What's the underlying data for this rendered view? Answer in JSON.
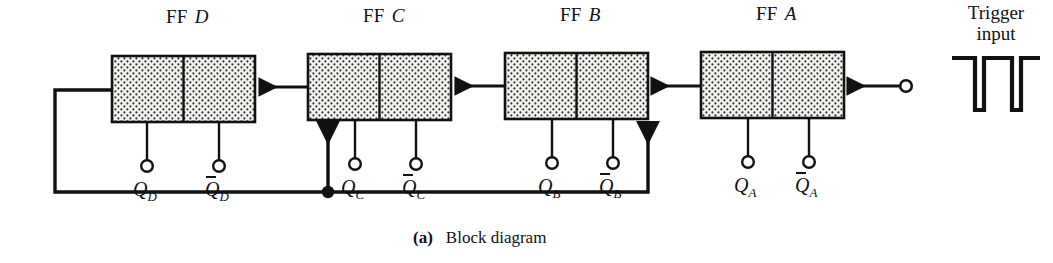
{
  "figure": {
    "caption_tag": "(a)",
    "caption_text": "Block diagram",
    "background_color": "#ffffff",
    "ink_color": "#111111"
  },
  "trigger": {
    "label_line1": "Trigger",
    "label_line2": "input",
    "waveform_description": "two negative-going pulses on a high level"
  },
  "flipflops": [
    {
      "id": "ff-d",
      "title_word": "FF",
      "title_letter": "D",
      "outputs": [
        {
          "name": "q-out",
          "symbol": "Q",
          "subscript": "D",
          "complement": false
        },
        {
          "name": "q-not-out",
          "symbol": "Q",
          "subscript": "D",
          "complement": true
        }
      ]
    },
    {
      "id": "ff-c",
      "title_word": "FF",
      "title_letter": "C",
      "outputs": [
        {
          "name": "q-out",
          "symbol": "Q",
          "subscript": "C",
          "complement": false
        },
        {
          "name": "q-not-out",
          "symbol": "Q",
          "subscript": "C",
          "complement": true
        }
      ]
    },
    {
      "id": "ff-b",
      "title_word": "FF",
      "title_letter": "B",
      "outputs": [
        {
          "name": "q-out",
          "symbol": "Q",
          "subscript": "B",
          "complement": false
        },
        {
          "name": "q-not-out",
          "symbol": "Q",
          "subscript": "B",
          "complement": true
        }
      ]
    },
    {
      "id": "ff-a",
      "title_word": "FF",
      "title_letter": "A",
      "outputs": [
        {
          "name": "q-out",
          "symbol": "Q",
          "subscript": "A",
          "complement": false
        },
        {
          "name": "q-not-out",
          "symbol": "Q",
          "subscript": "A",
          "complement": true
        }
      ]
    }
  ]
}
